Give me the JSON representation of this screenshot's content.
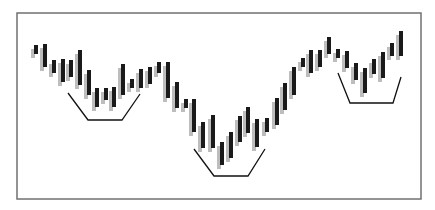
{
  "chart_data": {
    "type": "bar",
    "subtype": "price-bars-with-shadow",
    "title": "",
    "xlabel": "",
    "ylabel": "",
    "grid": false,
    "legend": null,
    "frame": {
      "x1": 17,
      "y1": 13,
      "x2": 421,
      "y2": 199,
      "color": "#707070"
    },
    "bar_style": {
      "width": 4,
      "color": "#1a1a1a",
      "shadow_color": "#bdbdbd",
      "shadow_dx": -3,
      "shadow_dy": 4
    },
    "bars": [
      {
        "x": 36,
        "top": 45,
        "bottom": 54
      },
      {
        "x": 45,
        "top": 44,
        "bottom": 67
      },
      {
        "x": 54,
        "top": 60,
        "bottom": 73
      },
      {
        "x": 63,
        "top": 59,
        "bottom": 82
      },
      {
        "x": 71,
        "top": 60,
        "bottom": 77
      },
      {
        "x": 80,
        "top": 50,
        "bottom": 85
      },
      {
        "x": 89,
        "top": 70,
        "bottom": 95
      },
      {
        "x": 97,
        "top": 88,
        "bottom": 107
      },
      {
        "x": 106,
        "top": 88,
        "bottom": 100
      },
      {
        "x": 114,
        "top": 87,
        "bottom": 107
      },
      {
        "x": 123,
        "top": 64,
        "bottom": 95
      },
      {
        "x": 132,
        "top": 79,
        "bottom": 88
      },
      {
        "x": 141,
        "top": 69,
        "bottom": 88
      },
      {
        "x": 150,
        "top": 67,
        "bottom": 84
      },
      {
        "x": 159,
        "top": 62,
        "bottom": 73
      },
      {
        "x": 168,
        "top": 62,
        "bottom": 98
      },
      {
        "x": 177,
        "top": 82,
        "bottom": 108
      },
      {
        "x": 186,
        "top": 99,
        "bottom": 108
      },
      {
        "x": 194,
        "top": 99,
        "bottom": 132
      },
      {
        "x": 203,
        "top": 122,
        "bottom": 148
      },
      {
        "x": 213,
        "top": 115,
        "bottom": 148
      },
      {
        "x": 222,
        "top": 142,
        "bottom": 165
      },
      {
        "x": 231,
        "top": 132,
        "bottom": 158
      },
      {
        "x": 240,
        "top": 116,
        "bottom": 142
      },
      {
        "x": 248,
        "top": 107,
        "bottom": 133
      },
      {
        "x": 257,
        "top": 119,
        "bottom": 147
      },
      {
        "x": 267,
        "top": 118,
        "bottom": 132
      },
      {
        "x": 277,
        "top": 98,
        "bottom": 125
      },
      {
        "x": 285,
        "top": 83,
        "bottom": 110
      },
      {
        "x": 294,
        "top": 67,
        "bottom": 95
      },
      {
        "x": 303,
        "top": 58,
        "bottom": 67
      },
      {
        "x": 311,
        "top": 50,
        "bottom": 73
      },
      {
        "x": 320,
        "top": 50,
        "bottom": 67
      },
      {
        "x": 329,
        "top": 37,
        "bottom": 54
      },
      {
        "x": 338,
        "top": 49,
        "bottom": 58
      },
      {
        "x": 347,
        "top": 51,
        "bottom": 68
      },
      {
        "x": 356,
        "top": 63,
        "bottom": 80
      },
      {
        "x": 365,
        "top": 68,
        "bottom": 93
      },
      {
        "x": 374,
        "top": 59,
        "bottom": 74
      },
      {
        "x": 383,
        "top": 52,
        "bottom": 78
      },
      {
        "x": 392,
        "top": 43,
        "bottom": 56
      },
      {
        "x": 401,
        "top": 31,
        "bottom": 56
      }
    ],
    "annotations": [
      {
        "type": "bracket",
        "label": "left-bottom",
        "points": [
          [
            68,
            93
          ],
          [
            88,
            120
          ],
          [
            122,
            120
          ],
          [
            140,
            94
          ]
        ]
      },
      {
        "type": "bracket",
        "label": "head-bottom",
        "points": [
          [
            194,
            149
          ],
          [
            214,
            176
          ],
          [
            248,
            176
          ],
          [
            265,
            149
          ]
        ]
      },
      {
        "type": "bracket",
        "label": "right-bottom",
        "points": [
          [
            338,
            73
          ],
          [
            350,
            103
          ],
          [
            393,
            103
          ],
          [
            401,
            77
          ]
        ]
      }
    ],
    "line_color": "#111111"
  }
}
